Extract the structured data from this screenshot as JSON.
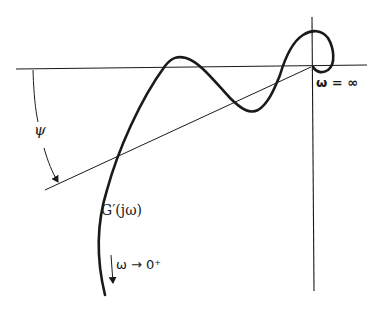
{
  "figure": {
    "type": "Nyquist plot with angle construction",
    "curve_label": "G′(jω)",
    "angle_label": "ψ",
    "high_freq_label": "ω = ∞",
    "low_freq_label": "ω → 0⁺",
    "colors": {
      "background": "#ffffff",
      "ink": "#1a1a1a"
    }
  }
}
